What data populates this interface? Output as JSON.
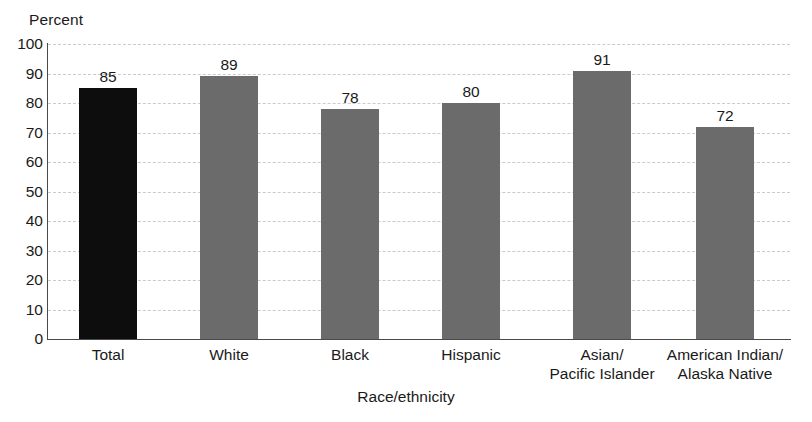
{
  "chart_data": {
    "type": "bar",
    "title": "",
    "xlabel": "Race/ethnicity",
    "ylabel": "Percent",
    "ylim": [
      0,
      100
    ],
    "ytick_step": 10,
    "yticks": [
      "100",
      "90",
      "80",
      "70",
      "60",
      "50",
      "40",
      "30",
      "20",
      "10",
      "0"
    ],
    "grid": true,
    "legend": "none",
    "categories": [
      "Total",
      "White",
      "Black",
      "Hispanic",
      "Asian/\nPacific Islander",
      "American Indian/\nAlaska Native"
    ],
    "values": [
      85,
      89,
      78,
      80,
      91,
      72
    ],
    "value_labels": [
      "85",
      "89",
      "78",
      "80",
      "91",
      "72"
    ],
    "bar_colors": [
      "#0d0d0d",
      "#6b6b6b",
      "#6b6b6b",
      "#6b6b6b",
      "#6b6b6b",
      "#6b6b6b"
    ],
    "colors": {
      "highlight_bar": "#0d0d0d",
      "standard_bar": "#6b6b6b",
      "gridline": "#c9c9cf",
      "axis": "#4a4a4a",
      "text": "#1a1a1a",
      "background": "#ffffff"
    }
  }
}
